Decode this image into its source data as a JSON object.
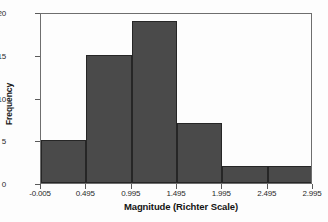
{
  "chart_data": {
    "type": "bar",
    "title": "",
    "subtitle": "",
    "xlabel": "Magnitude (Richter Scale)",
    "ylabel": "Frequency",
    "categories": [
      "-0.005 to 0.495",
      "0.495 to 0.995",
      "0.995 to 1.495",
      "1.495 to 1.995",
      "1.995 to 2.495",
      "2.495 to 2.995"
    ],
    "bin_edges": [
      -0.005,
      0.495,
      0.995,
      1.495,
      1.995,
      2.495,
      2.995
    ],
    "values": [
      5,
      15,
      19,
      7,
      2,
      2
    ],
    "series": [
      {
        "name": "Frequency",
        "values": [
          5,
          15,
          19,
          7,
          2,
          2
        ]
      }
    ],
    "xlim": [
      -0.005,
      2.995
    ],
    "ylim": [
      0,
      20
    ],
    "x_ticks": [
      -0.005,
      0.495,
      0.995,
      1.495,
      1.995,
      2.495,
      2.995
    ],
    "x_tick_labels": [
      "-0.005",
      "0.495",
      "0.995",
      "1.495",
      "1.995",
      "2.495",
      "2.995"
    ],
    "y_ticks": [
      0,
      5,
      10,
      15,
      20
    ],
    "y_tick_labels": [
      "0",
      "5",
      "10",
      "15",
      "20"
    ],
    "grid": false,
    "legend": false,
    "legend_position": "none",
    "bar_color": "#4a4a4a",
    "bar_edge_color": "#262626",
    "plot_background": "#fdfdfd",
    "axis_color": "#6e6e6e",
    "annotations": []
  }
}
